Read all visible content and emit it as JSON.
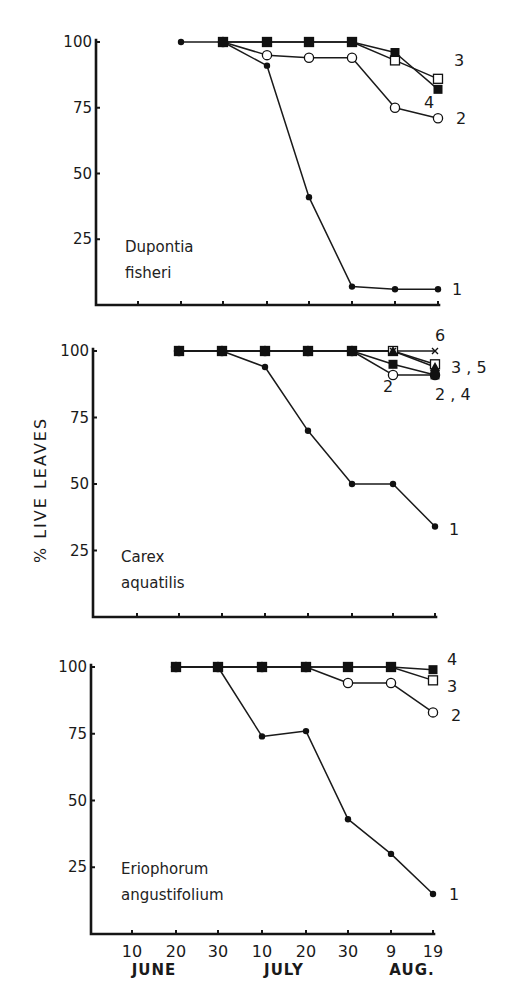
{
  "figure": {
    "ylabel": "% LIVE LEAVES",
    "x_ticks": [
      "10",
      "20",
      "30",
      "10",
      "20",
      "30",
      "9",
      "19"
    ],
    "x_months": [
      {
        "label": "JUNE",
        "tick_index": 0.5
      },
      {
        "label": "JULY",
        "tick_index": 3.5
      },
      {
        "label": "AUG.",
        "tick_index": 6.5
      }
    ],
    "y_ticks": [
      100,
      75,
      50,
      25
    ]
  },
  "chart_data": [
    {
      "type": "line",
      "title": "Dupontia fisheri",
      "species_lines": [
        "Dupontia",
        "fisheri"
      ],
      "xlabel": "Date (June–Aug.)",
      "ylabel": "% LIVE LEAVES",
      "ylim": [
        0,
        100
      ],
      "grid": false,
      "x": [
        "June 10",
        "June 20",
        "June 30",
        "July 10",
        "July 20",
        "July 30",
        "Aug 9",
        "Aug 19"
      ],
      "series": [
        {
          "name": "1",
          "marker": "dot",
          "values": [
            null,
            100,
            100,
            91,
            41,
            7,
            6,
            6
          ]
        },
        {
          "name": "2",
          "marker": "open-circle",
          "values": [
            null,
            null,
            100,
            95,
            94,
            94,
            75,
            71
          ]
        },
        {
          "name": "3",
          "marker": "open-square",
          "values": [
            null,
            null,
            100,
            100,
            100,
            100,
            93,
            86
          ]
        },
        {
          "name": "4",
          "marker": "filled-square",
          "values": [
            null,
            null,
            100,
            100,
            100,
            100,
            96,
            82
          ]
        }
      ],
      "end_labels": [
        {
          "text": "3",
          "dx": 16,
          "value": 93
        },
        {
          "text": "4",
          "dx": -14,
          "value": 77
        },
        {
          "text": "2",
          "dx": 18,
          "value": 71
        },
        {
          "text": "1",
          "dx": 14,
          "value": 6
        }
      ]
    },
    {
      "type": "line",
      "title": "Carex aquatilis",
      "species_lines": [
        "Carex",
        "aquatilis"
      ],
      "xlabel": "Date (June–Aug.)",
      "ylabel": "% LIVE LEAVES",
      "ylim": [
        0,
        100
      ],
      "grid": false,
      "x": [
        "June 10",
        "June 20",
        "June 30",
        "July 10",
        "July 20",
        "July 30",
        "Aug 9",
        "Aug 19"
      ],
      "series": [
        {
          "name": "1",
          "marker": "dot",
          "values": [
            null,
            100,
            100,
            94,
            70,
            50,
            50,
            34
          ]
        },
        {
          "name": "2",
          "marker": "open-circle",
          "values": [
            null,
            100,
            100,
            100,
            100,
            100,
            91,
            91
          ]
        },
        {
          "name": "3",
          "marker": "open-square",
          "values": [
            null,
            100,
            100,
            100,
            100,
            100,
            100,
            95
          ]
        },
        {
          "name": "4",
          "marker": "filled-square",
          "values": [
            null,
            100,
            100,
            100,
            100,
            100,
            95,
            91
          ]
        },
        {
          "name": "5",
          "marker": "filled-triangle",
          "values": [
            null,
            100,
            100,
            100,
            100,
            100,
            100,
            94
          ]
        },
        {
          "name": "6",
          "marker": "cross",
          "values": [
            null,
            100,
            100,
            100,
            100,
            100,
            100,
            100
          ]
        }
      ],
      "end_labels": [
        {
          "text": "6",
          "dx": 0,
          "value": 106
        },
        {
          "text": "3 , 5",
          "dx": 16,
          "value": 94
        },
        {
          "text": "2 , 4",
          "dx": 0,
          "value": 84
        },
        {
          "text": "2",
          "dx": -52,
          "value": 87
        },
        {
          "text": "1",
          "dx": 14,
          "value": 33
        }
      ]
    },
    {
      "type": "line",
      "title": "Eriophorum angustifolium",
      "species_lines": [
        "Eriophorum",
        "angustifolium"
      ],
      "xlabel": "Date (June–Aug.)",
      "ylabel": "% LIVE LEAVES",
      "ylim": [
        0,
        100
      ],
      "grid": false,
      "x": [
        "June 10",
        "June 20",
        "June 30",
        "July 10",
        "July 20",
        "July 30",
        "Aug 9",
        "Aug 19"
      ],
      "series": [
        {
          "name": "1",
          "marker": "dot",
          "values": [
            null,
            100,
            100,
            74,
            76,
            43,
            30,
            15
          ]
        },
        {
          "name": "2",
          "marker": "open-circle",
          "values": [
            null,
            100,
            100,
            100,
            100,
            94,
            94,
            83
          ]
        },
        {
          "name": "3",
          "marker": "open-square",
          "values": [
            null,
            100,
            100,
            100,
            100,
            100,
            100,
            95
          ]
        },
        {
          "name": "4",
          "marker": "filled-square",
          "values": [
            null,
            100,
            100,
            100,
            100,
            100,
            100,
            99
          ]
        }
      ],
      "end_labels": [
        {
          "text": "4",
          "dx": 14,
          "value": 103
        },
        {
          "text": "3",
          "dx": 14,
          "value": 93
        },
        {
          "text": "2",
          "dx": 18,
          "value": 82
        },
        {
          "text": "1",
          "dx": 16,
          "value": 15
        }
      ]
    }
  ]
}
